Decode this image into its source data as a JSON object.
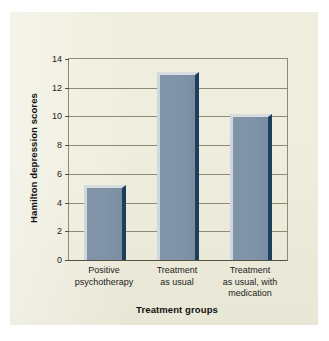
{
  "figure": {
    "panel_background": "#efeede",
    "page_background": "#ffffff"
  },
  "chart_data": {
    "type": "bar",
    "title": "",
    "subtitle": "",
    "xlabel": "Treatment groups",
    "ylabel": "Hamilton depression scores",
    "categories": [
      "Positive psychotherapy",
      "Treatment as usual",
      "Treatment as usual, with medication"
    ],
    "category_lines": [
      [
        "Positive",
        "psychotherapy"
      ],
      [
        "Treatment",
        "as usual"
      ],
      [
        "Treatment",
        "as usual, with",
        "medication"
      ]
    ],
    "values": [
      5.2,
      13.1,
      10.2
    ],
    "ylim": [
      0,
      14
    ],
    "yticks": [
      0,
      2,
      4,
      6,
      8,
      10,
      12,
      14
    ],
    "ytick_labels": [
      "0",
      "2",
      "4",
      "6",
      "8",
      "10",
      "12",
      "14"
    ],
    "grid": true,
    "grid_axis": "y",
    "legend": false,
    "legend_position": "none",
    "bar_color": "#7f92a6",
    "bar_highlight_color": "#d8dde2",
    "bar_shadow_color": "#1d3f5c",
    "axis_color": "#55513f",
    "grid_color": "#8e8a74"
  }
}
